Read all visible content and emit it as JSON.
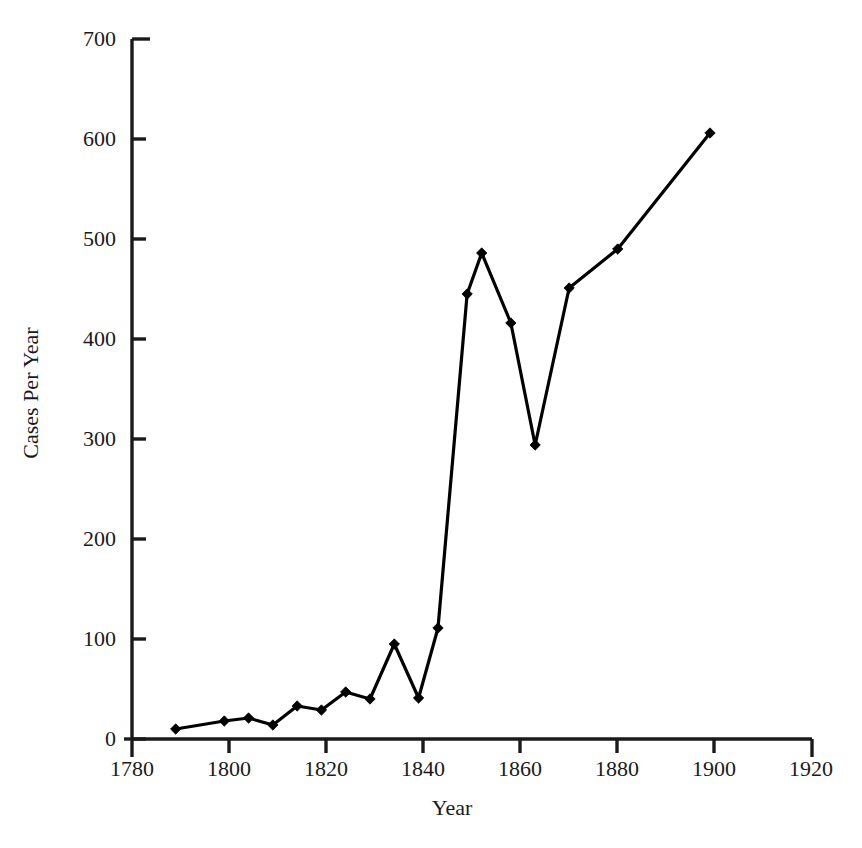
{
  "chart_data": {
    "type": "line",
    "title": "",
    "xlabel": "Year",
    "ylabel": "Cases Per Year",
    "xlim": [
      1780,
      1920
    ],
    "ylim": [
      0,
      700
    ],
    "xticks": [
      1780,
      1800,
      1820,
      1840,
      1860,
      1880,
      1900,
      1920
    ],
    "xtick_labels": [
      "1780",
      "1800",
      "1820",
      "1840",
      "1860",
      "1880",
      "1900",
      "1920"
    ],
    "x_minor_tick_interval": 10,
    "yticks": [
      0,
      100,
      200,
      300,
      400,
      500,
      600,
      700
    ],
    "ytick_labels": [
      "0",
      "100",
      "200",
      "300",
      "400",
      "500",
      "600",
      "700"
    ],
    "grid": false,
    "legend": null,
    "marker": "diamond",
    "line_color": "#000000",
    "marker_color": "#000000",
    "x": [
      1789,
      1799,
      1804,
      1809,
      1814,
      1819,
      1824,
      1829,
      1834,
      1839,
      1843,
      1849,
      1852,
      1858,
      1863,
      1870,
      1880,
      1899
    ],
    "values": [
      10,
      18,
      21,
      14,
      33,
      29,
      47,
      40,
      95,
      41,
      111,
      445,
      486,
      416,
      294,
      451,
      490,
      606
    ],
    "points": [
      {
        "x": 1789,
        "y": 10
      },
      {
        "x": 1799,
        "y": 18
      },
      {
        "x": 1804,
        "y": 21
      },
      {
        "x": 1809,
        "y": 14
      },
      {
        "x": 1814,
        "y": 33
      },
      {
        "x": 1819,
        "y": 29
      },
      {
        "x": 1824,
        "y": 47
      },
      {
        "x": 1829,
        "y": 40
      },
      {
        "x": 1834,
        "y": 95
      },
      {
        "x": 1839,
        "y": 41
      },
      {
        "x": 1843,
        "y": 111
      },
      {
        "x": 1849,
        "y": 445
      },
      {
        "x": 1852,
        "y": 486
      },
      {
        "x": 1858,
        "y": 416
      },
      {
        "x": 1863,
        "y": 294
      },
      {
        "x": 1870,
        "y": 451
      },
      {
        "x": 1880,
        "y": 490
      },
      {
        "x": 1899,
        "y": 606
      }
    ]
  },
  "axes": {
    "x_axis_label": "Year",
    "y_axis_label": "Cases Per Year",
    "y_tick_labels": [
      "700",
      "600",
      "500",
      "400",
      "300",
      "200",
      "100",
      "0"
    ],
    "x_tick_labels": [
      "1780",
      "1800",
      "1820",
      "1840",
      "1860",
      "1880",
      "1900",
      "1920"
    ]
  },
  "colors": {
    "line": "#000000",
    "axis": "#1a1a1a",
    "background": "#ffffff",
    "text": "#1a1a1a"
  }
}
